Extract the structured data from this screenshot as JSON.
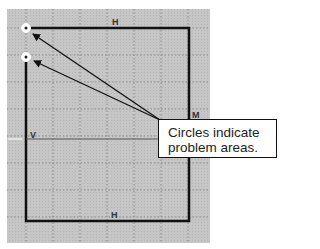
{
  "diagram": {
    "background": "#ffffff",
    "grid_area": {
      "x": 7,
      "y": 9,
      "width": 203,
      "height": 234,
      "fill": "#c4c4c4",
      "grid_color": "#8a8a8a",
      "spacing": 27
    },
    "shape": {
      "x1": 26,
      "y1": 28,
      "x2": 189,
      "y2": 221,
      "stroke": "#111111"
    },
    "markers": [
      {
        "label": "H",
        "x": 112,
        "y": 25
      },
      {
        "label": "V",
        "x": 30,
        "y": 138
      },
      {
        "label": "H",
        "x": 111,
        "y": 218
      },
      {
        "label": "M",
        "x": 192,
        "y": 118
      }
    ],
    "problem_circles": [
      {
        "cx": 26,
        "cy": 28
      },
      {
        "cx": 26,
        "cy": 57
      }
    ],
    "arrows": [
      {
        "from": [
          160,
          120
        ],
        "to": [
          33,
          34
        ]
      },
      {
        "from": [
          160,
          120
        ],
        "to": [
          34,
          61
        ]
      }
    ]
  },
  "callout": {
    "line1": "Circles indicate",
    "line2": "problem areas."
  }
}
